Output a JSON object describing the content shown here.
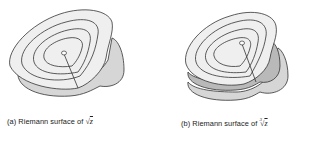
{
  "figures": [
    {
      "id": "a",
      "label": "(a)",
      "caption_text": "Riemann surface of",
      "math_radical": "√",
      "math_index": "",
      "math_var": "z",
      "sheets": 2
    },
    {
      "id": "b",
      "label": "(b)",
      "caption_text": "Riemann surface of",
      "math_radical": "√",
      "math_index": "3",
      "math_var": "z",
      "sheets": 3
    }
  ],
  "colors": {
    "top_sheet": "#efefef",
    "lower_sheet": "#d6d6d6",
    "middle_sheet": "#b9b9b9",
    "outline": "#333333"
  }
}
